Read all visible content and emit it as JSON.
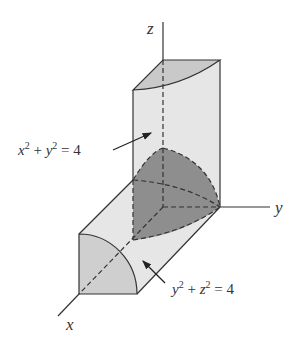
{
  "figure": {
    "axes": {
      "x": "x",
      "y": "y",
      "z": "z"
    },
    "labels": {
      "cyl1": {
        "lhs_a": "x",
        "exp_a": "2",
        "plus": " + ",
        "lhs_b": "y",
        "exp_b": "2",
        "rhs": " = 4"
      },
      "cyl2": {
        "lhs_a": "y",
        "exp_a": "2",
        "plus": " + ",
        "lhs_b": "z",
        "exp_b": "2",
        "rhs": " = 4"
      }
    },
    "colors": {
      "light_face": "#e3e3e3",
      "mid_face": "#c9c9c9",
      "dark_solid": "#8c8c8c",
      "line": "#333333"
    }
  }
}
